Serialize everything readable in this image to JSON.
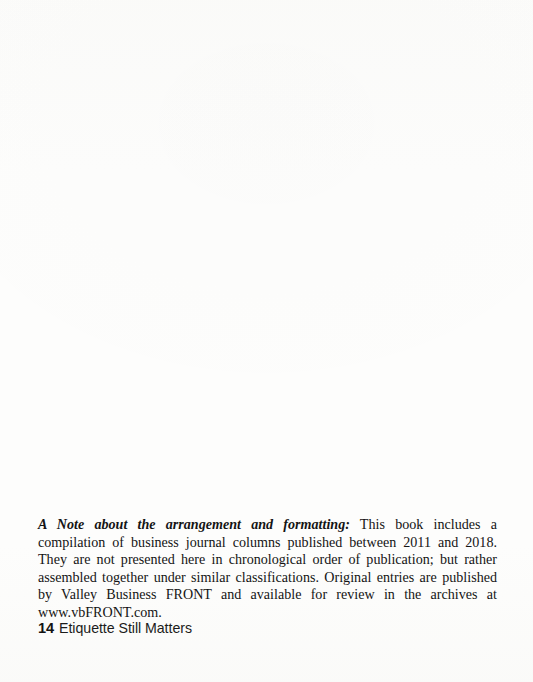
{
  "page": {
    "background_color": "#fdfdfc",
    "text_color": "#141414",
    "body": {
      "note": {
        "lead_in": "A Note about the arrangement and formatting:",
        "text": " This book includes a compilation of business journal columns published between 2011 and 2018. They are not presented here in chronological order of publication; but rather assembled together under similar classifications. Original entries are published by Valley Business FRONT and available for review in the archives at www.vbFRONT.com."
      }
    },
    "footer": {
      "page_number": "14",
      "running_title": "Etiquette Still Matters"
    }
  }
}
